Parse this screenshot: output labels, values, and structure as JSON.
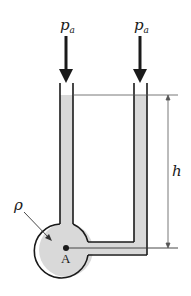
{
  "diagram": {
    "labels": {
      "pressure_left": "p",
      "pressure_left_sub": "a",
      "pressure_right": "p",
      "pressure_right_sub": "a",
      "height": "h",
      "density": "ρ",
      "point": "A"
    },
    "colors": {
      "fluid": "#d9d9d9",
      "outline": "#1a1a1a",
      "dimension": "#555555",
      "background": "#ffffff"
    }
  }
}
